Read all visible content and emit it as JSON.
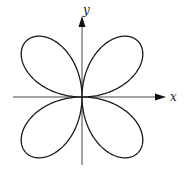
{
  "diagram": {
    "type": "polar-rose",
    "equation_form": "r = a·sin(2θ)",
    "petals": 4,
    "axes": {
      "x_label": "x",
      "y_label": "y"
    },
    "colors": {
      "curve": "#1a1a1a",
      "axes": "#333333",
      "background": "#ffffff"
    }
  }
}
